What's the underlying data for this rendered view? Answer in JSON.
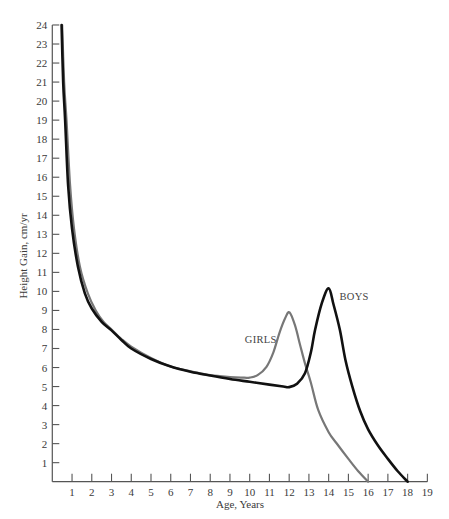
{
  "chart_data": {
    "type": "line",
    "title": "",
    "xlabel": "Age, Years",
    "ylabel": "Height Gain, cm/yr",
    "xlim": [
      0,
      19
    ],
    "ylim": [
      0,
      24
    ],
    "grid": false,
    "legend": "none (direct labels on curves)",
    "x_ticks": [
      1,
      2,
      3,
      4,
      5,
      6,
      7,
      8,
      9,
      10,
      11,
      12,
      13,
      14,
      15,
      16,
      17,
      18,
      19
    ],
    "y_ticks": [
      1,
      2,
      3,
      4,
      5,
      6,
      7,
      8,
      9,
      10,
      11,
      12,
      13,
      14,
      15,
      16,
      17,
      18,
      19,
      20,
      21,
      22,
      23,
      24
    ],
    "series": [
      {
        "name": "BOYS",
        "color": "#111111",
        "width": 2.6,
        "x": [
          0.47,
          0.55,
          0.65,
          0.8,
          1.0,
          1.3,
          1.65,
          2.0,
          2.5,
          3.0,
          3.5,
          4.0,
          5.0,
          6.0,
          7.0,
          8.0,
          9.0,
          10.0,
          11.0,
          11.7,
          12.0,
          12.4,
          12.8,
          13.1,
          13.31,
          13.65,
          14.0,
          14.25,
          14.57,
          14.85,
          15.2,
          15.6,
          16.0,
          16.5,
          17.0,
          17.5,
          18.0
        ],
        "values": [
          24,
          21,
          19,
          15.6,
          13.3,
          11.3,
          9.9,
          9.1,
          8.4,
          7.95,
          7.45,
          7.0,
          6.45,
          6.05,
          5.78,
          5.58,
          5.4,
          5.25,
          5.1,
          5.0,
          4.97,
          5.15,
          5.7,
          6.8,
          7.97,
          9.37,
          10.16,
          9.3,
          7.97,
          6.4,
          5.0,
          3.7,
          2.75,
          1.9,
          1.2,
          0.55,
          0
        ]
      },
      {
        "name": "GIRLS",
        "color": "#777777",
        "width": 2.2,
        "x": [
          0.5,
          0.6,
          0.72,
          0.9,
          1.1,
          1.4,
          1.8,
          2.2,
          2.6,
          3.0,
          3.5,
          4.0,
          5.0,
          6.0,
          7.0,
          8.0,
          9.0,
          9.6,
          10.0,
          10.4,
          10.85,
          11.2,
          11.5,
          11.8,
          12.02,
          12.3,
          12.55,
          12.8,
          13.1,
          13.47,
          14.0,
          14.4,
          15.0,
          15.5,
          16.0
        ],
        "values": [
          24,
          21,
          19,
          15.6,
          13.3,
          11.3,
          9.9,
          9.0,
          8.4,
          8.0,
          7.5,
          7.1,
          6.5,
          6.05,
          5.8,
          5.6,
          5.5,
          5.47,
          5.47,
          5.6,
          6.04,
          6.8,
          7.8,
          8.6,
          8.9,
          8.2,
          7.2,
          6.22,
          5.2,
          3.77,
          2.6,
          2.02,
          1.2,
          0.55,
          0
        ]
      }
    ],
    "annotations": [
      {
        "text": "GIRLS",
        "x": 9.75,
        "y": 7.3
      },
      {
        "text": "BOYS",
        "x": 14.55,
        "y": 9.55
      }
    ]
  }
}
